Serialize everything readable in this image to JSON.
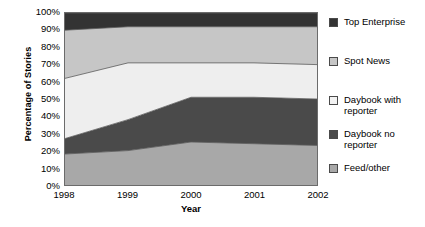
{
  "chart_data": {
    "type": "area",
    "stacked": "100%",
    "title": "",
    "xlabel": "Year",
    "ylabel": "Percentage of Stories",
    "x": [
      "1998",
      "1999",
      "2000",
      "2001",
      "2002"
    ],
    "categories": [
      "1998",
      "1999",
      "2000",
      "2001",
      "2002"
    ],
    "ylim": [
      0,
      100
    ],
    "ytick_labels": [
      "0%",
      "10%",
      "20%",
      "30%",
      "40%",
      "50%",
      "60%",
      "70%",
      "80%",
      "90%",
      "100%"
    ],
    "ytick_values": [
      0,
      10,
      20,
      30,
      40,
      50,
      60,
      70,
      80,
      90,
      100
    ],
    "grid": false,
    "legend_position": "right",
    "stack_order_bottom_to_top": [
      "Feed/other",
      "Daybook no reporter",
      "Daybook with reporter",
      "Spot News",
      "Top Enterprise"
    ],
    "series": [
      {
        "name": "Feed/other",
        "color": "#a8a8a8",
        "values": [
          18,
          20,
          25,
          24,
          23
        ],
        "cumulative_top": [
          18,
          20,
          25,
          24,
          23
        ]
      },
      {
        "name": "Daybook no reporter",
        "color": "#4a4a4a",
        "values": [
          9,
          18,
          26,
          27,
          27
        ],
        "cumulative_top": [
          27,
          38,
          51,
          51,
          50
        ]
      },
      {
        "name": "Daybook with reporter",
        "color": "#eeeeee",
        "values": [
          35,
          33,
          20,
          20,
          20
        ],
        "cumulative_top": [
          62,
          71,
          71,
          71,
          70
        ]
      },
      {
        "name": "Spot News",
        "color": "#c6c6c6",
        "values": [
          28,
          21,
          21,
          21,
          22
        ],
        "cumulative_top": [
          90,
          92,
          92,
          92,
          92
        ]
      },
      {
        "name": "Top Enterprise",
        "color": "#333333",
        "values": [
          10,
          8,
          8,
          8,
          8
        ],
        "cumulative_top": [
          100,
          100,
          100,
          100,
          100
        ]
      }
    ]
  },
  "axes": {
    "y_title": "Percentage of Stories",
    "x_title": "Year",
    "y_ticks": [
      "100%",
      "90%",
      "80%",
      "70%",
      "60%",
      "50%",
      "40%",
      "30%",
      "20%",
      "10%",
      "0%"
    ],
    "x_ticks": [
      "1998",
      "1999",
      "2000",
      "2001",
      "2002"
    ]
  },
  "legend": {
    "items": [
      {
        "label": "Top Enterprise",
        "color": "#333333"
      },
      {
        "label": "Spot News",
        "color": "#c6c6c6"
      },
      {
        "label": "Daybook with\nreporter",
        "color": "#f2f2f2"
      },
      {
        "label": "Daybook no\nreporter",
        "color": "#4a4a4a"
      },
      {
        "label": "Feed/other",
        "color": "#a8a8a8"
      }
    ]
  },
  "colors": {
    "plot_border": "#6b6b6b",
    "series_outline": "#5a5a5a",
    "background": "#ffffff",
    "text": "#000000"
  }
}
